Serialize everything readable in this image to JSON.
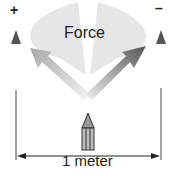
{
  "diagram": {
    "label_force": "Force",
    "label_plus": "+",
    "label_minus": "–",
    "label_distance": "1 meter",
    "colors": {
      "cloud": "#e4e4e4",
      "arrow_left": "#b0b0b0",
      "arrow_right": "#6a6a6a",
      "charge": "#555555",
      "pencil": "#8a8a8a",
      "line": "#333333"
    }
  }
}
